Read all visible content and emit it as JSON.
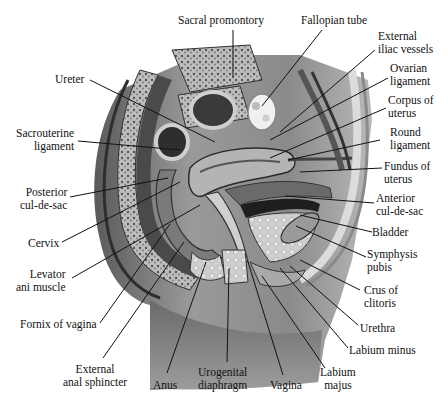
{
  "figure": {
    "colors": {
      "background": "#ffffff",
      "ink": "#111111",
      "tissue_dark": "#3a3a3a",
      "tissue_mid": "#8a8a8a",
      "tissue_light": "#d6d6d6"
    }
  },
  "labels": {
    "sacral_promontory": {
      "lines": [
        "Sacral promontory"
      ]
    },
    "fallopian_tube": {
      "lines": [
        "Fallopian tube"
      ]
    },
    "external_iliac_vessels": {
      "lines": [
        "External",
        "iliac vessels"
      ]
    },
    "ovarian_ligament": {
      "lines": [
        "Ovarian",
        "ligament"
      ]
    },
    "corpus_of_uterus": {
      "lines": [
        "Corpus of",
        "uterus"
      ]
    },
    "round_ligament": {
      "lines": [
        "Round",
        "ligament"
      ]
    },
    "fundus_of_uterus": {
      "lines": [
        "Fundus of",
        "uterus"
      ]
    },
    "anterior_cul_de_sac": {
      "lines": [
        "Anterior",
        "cul-de-sac"
      ]
    },
    "bladder": {
      "lines": [
        "Bladder"
      ]
    },
    "symphysis_pubis": {
      "lines": [
        "Symphysis",
        "pubis"
      ]
    },
    "crus_of_clitoris": {
      "lines": [
        "Crus of",
        "clitoris"
      ]
    },
    "urethra": {
      "lines": [
        "Urethra"
      ]
    },
    "labium_minus": {
      "lines": [
        "Labium minus"
      ]
    },
    "labium_majus": {
      "lines": [
        "Labium",
        "majus"
      ]
    },
    "vagina": {
      "lines": [
        "Vagina"
      ]
    },
    "urogenital_diaphragm": {
      "lines": [
        "Urogenital",
        "diaphragm"
      ]
    },
    "anus": {
      "lines": [
        "Anus"
      ]
    },
    "external_anal_sphincter": {
      "lines": [
        "External",
        "anal sphincter"
      ]
    },
    "fornix_of_vagina": {
      "lines": [
        "Fornix of vagina"
      ]
    },
    "levator_ani_muscle": {
      "lines": [
        "Levator",
        "ani muscle"
      ]
    },
    "cervix": {
      "lines": [
        "Cervix"
      ]
    },
    "posterior_cul_de_sac": {
      "lines": [
        "Posterior",
        "cul-de-sac"
      ]
    },
    "sacrouterine_ligament": {
      "lines": [
        "Sacrouterine",
        "ligament"
      ]
    },
    "ureter": {
      "lines": [
        "Ureter"
      ]
    }
  }
}
